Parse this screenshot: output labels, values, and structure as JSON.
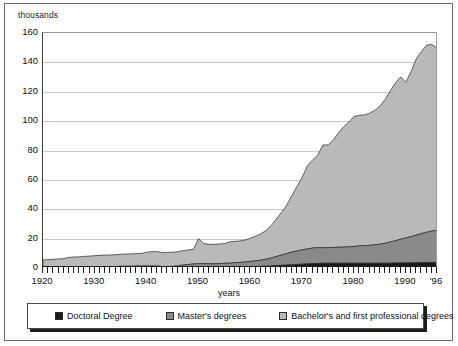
{
  "figure": {
    "y_unit_label": "thousands",
    "x_axis_title": "years"
  },
  "legend": {
    "items": [
      {
        "label": "Doctoral Degree",
        "color": "#1a1a1a"
      },
      {
        "label": "Master's degrees",
        "color": "#8a8a8a"
      },
      {
        "label": "Bachelor's and first professional degrees",
        "color": "#b9b9b9"
      }
    ]
  },
  "chart_data": {
    "type": "area",
    "title": "",
    "subtitle": "",
    "xlabel": "years",
    "ylabel": "thousands",
    "ylim": [
      0,
      160
    ],
    "xlim": [
      1920,
      1996
    ],
    "ytick_labels": [
      "160",
      "140",
      "120",
      "100",
      "80",
      "60",
      "40",
      "20",
      "0"
    ],
    "ytick_values": [
      160,
      140,
      120,
      100,
      80,
      60,
      40,
      20,
      0
    ],
    "xtick_labels": [
      "1920",
      "1930",
      "1940",
      "1950",
      "1960",
      "1970",
      "1980",
      "1990",
      "'96"
    ],
    "xtick_values": [
      1920,
      1930,
      1940,
      1950,
      1960,
      1970,
      1980,
      1990,
      1996
    ],
    "grid": true,
    "legend_position": "bottom",
    "stacked": true,
    "stack_order": [
      "Doctoral Degree",
      "Master's degrees",
      "Bachelor's and first professional degrees"
    ],
    "x": [
      1920,
      1921,
      1922,
      1923,
      1924,
      1925,
      1926,
      1927,
      1928,
      1929,
      1930,
      1931,
      1932,
      1933,
      1934,
      1935,
      1936,
      1937,
      1938,
      1939,
      1940,
      1941,
      1942,
      1943,
      1944,
      1945,
      1946,
      1947,
      1948,
      1949,
      1950,
      1951,
      1952,
      1953,
      1954,
      1955,
      1956,
      1957,
      1958,
      1959,
      1960,
      1961,
      1962,
      1963,
      1964,
      1965,
      1966,
      1967,
      1968,
      1969,
      1970,
      1971,
      1972,
      1973,
      1974,
      1975,
      1976,
      1977,
      1978,
      1979,
      1980,
      1981,
      1982,
      1983,
      1984,
      1985,
      1986,
      1987,
      1988,
      1989,
      1990,
      1991,
      1992,
      1993,
      1994,
      1995,
      1996
    ],
    "series": [
      {
        "name": "Doctoral Degree",
        "color": "#1a1a1a",
        "values": [
          0.1,
          0.1,
          0.1,
          0.1,
          0.1,
          0.1,
          0.1,
          0.1,
          0.2,
          0.2,
          0.2,
          0.2,
          0.2,
          0.2,
          0.2,
          0.3,
          0.3,
          0.3,
          0.3,
          0.3,
          0.3,
          0.3,
          0.3,
          0.2,
          0.2,
          0.2,
          0.2,
          0.3,
          0.4,
          0.5,
          0.6,
          0.6,
          0.6,
          0.6,
          0.6,
          0.7,
          0.7,
          0.8,
          0.8,
          0.9,
          1.0,
          1.0,
          1.1,
          1.2,
          1.4,
          1.6,
          1.8,
          2.0,
          2.2,
          2.4,
          2.6,
          2.8,
          3.0,
          3.1,
          3.2,
          3.2,
          3.2,
          3.2,
          3.2,
          3.2,
          3.2,
          3.2,
          3.2,
          3.2,
          3.2,
          3.2,
          3.2,
          3.3,
          3.4,
          3.4,
          3.5,
          3.5,
          3.6,
          3.6,
          3.7,
          3.7,
          3.8
        ]
      },
      {
        "name": "Master's degrees",
        "color": "#8a8a8a",
        "values": [
          0.4,
          0.4,
          0.4,
          0.5,
          0.5,
          0.5,
          0.6,
          0.6,
          0.7,
          0.7,
          0.8,
          0.8,
          0.8,
          0.8,
          0.8,
          0.9,
          0.9,
          0.9,
          1.0,
          1.0,
          1.0,
          1.0,
          1.0,
          0.8,
          0.8,
          0.9,
          1.2,
          1.7,
          2.0,
          2.2,
          2.4,
          2.4,
          2.3,
          2.3,
          2.4,
          2.5,
          2.6,
          2.8,
          3.0,
          3.2,
          3.5,
          3.8,
          4.2,
          4.7,
          5.4,
          6.2,
          7.0,
          7.8,
          8.6,
          9.2,
          9.7,
          10.2,
          10.6,
          10.8,
          10.6,
          10.6,
          10.8,
          10.9,
          11.0,
          11.2,
          11.5,
          11.8,
          12.0,
          12.2,
          12.6,
          13.0,
          13.6,
          14.4,
          15.2,
          16.2,
          17.0,
          17.8,
          18.8,
          19.8,
          20.6,
          21.4,
          22.0
        ]
      },
      {
        "name": "Bachelor's and first professional degrees",
        "color": "#b9b9b9",
        "values": [
          5.0,
          5.2,
          5.4,
          5.6,
          5.8,
          6.6,
          6.8,
          6.9,
          7.0,
          7.2,
          7.4,
          7.6,
          7.8,
          7.9,
          8.0,
          8.1,
          8.3,
          8.4,
          8.5,
          8.6,
          9.5,
          9.8,
          9.9,
          9.6,
          9.6,
          9.6,
          9.7,
          9.8,
          9.9,
          10.0,
          17.0,
          13.6,
          13.2,
          13.2,
          13.3,
          13.4,
          14.5,
          14.6,
          14.6,
          15.0,
          15.8,
          16.8,
          18.0,
          19.6,
          22.0,
          25.5,
          29.0,
          33.0,
          38.5,
          44.0,
          49.5,
          56.5,
          60.0,
          63.0,
          70.0,
          70.0,
          73.0,
          78.0,
          82.0,
          85.0,
          88.5,
          89.0,
          89.0,
          90.0,
          91.5,
          94.0,
          98.0,
          103.0,
          107.5,
          110.5,
          106.0,
          112.5,
          120.0,
          124.0,
          127.5,
          127.0,
          124.0
        ]
      }
    ],
    "totals_note": {
      "peak_total": 153,
      "peak_year": 1994,
      "start_total": 5.5,
      "end_total": 149.8
    }
  }
}
